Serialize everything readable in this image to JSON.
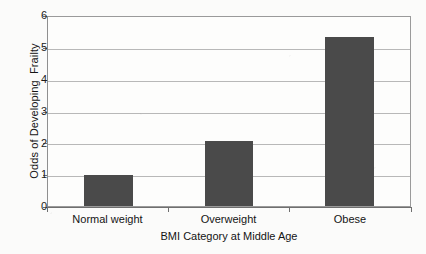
{
  "chart_data": {
    "type": "bar",
    "title": "",
    "categories": [
      "Normal weight",
      "Overweight",
      "Obese"
    ],
    "values": [
      1.0,
      2.07,
      5.37
    ],
    "xlabel": "BMI Category at Middle Age",
    "ylabel": "Odds of Developing  Frailty",
    "ylim": [
      0,
      6
    ],
    "yticks": [
      0,
      1,
      2,
      3,
      4,
      5,
      6
    ],
    "ytick_labels": [
      "0",
      "1",
      "2",
      "3",
      "4",
      "5",
      "6"
    ],
    "grid": true,
    "grid_axis": "y",
    "legend": false,
    "legend_position": "none",
    "bar_color": "#4a4a4a",
    "gridline_color": "#b8b8b8",
    "axis_color": "#6f6f6f",
    "background_color": "#fbfbfa",
    "plot_background_color": "#fdfdfc"
  }
}
